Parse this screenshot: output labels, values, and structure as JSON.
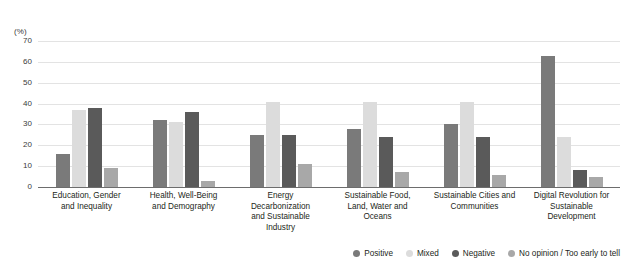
{
  "chart_data": {
    "type": "bar",
    "title": "",
    "subtitle": "",
    "xlabel": "",
    "ylabel": "",
    "unit_label": "(%)",
    "ylim": [
      0,
      70
    ],
    "yticks": [
      0,
      10,
      20,
      30,
      40,
      50,
      60,
      70
    ],
    "grid": true,
    "legend_position": "bottom-right",
    "categories": [
      "Education, Gender and Inequality",
      "Health, Well-Being and Demography",
      "Energy Decarbonization and Sustainable Industry",
      "Sustainable Food, Land, Water and Oceans",
      "Sustainable Cities and Communities",
      "Digital Revolution for Sustainable Development"
    ],
    "category_lines": [
      [
        "Education, Gender",
        "and Inequality"
      ],
      [
        "Health, Well-Being",
        "and Demography"
      ],
      [
        "Energy",
        "Decarbonization",
        "and Sustainable",
        "Industry"
      ],
      [
        "Sustainable Food,",
        "Land, Water and",
        "Oceans"
      ],
      [
        "Sustainable Cities and",
        "Communities"
      ],
      [
        "Digital Revolution for",
        "Sustainable",
        "Development"
      ]
    ],
    "series": [
      {
        "name": "Positive",
        "color": "#7a7a7a",
        "values": [
          16,
          32,
          25,
          28,
          30,
          63
        ]
      },
      {
        "name": "Mixed",
        "color": "#dcdcdc",
        "values": [
          37,
          31,
          41,
          41,
          41,
          24
        ]
      },
      {
        "name": "Negative",
        "color": "#5a5a5a",
        "values": [
          38,
          36,
          25,
          24,
          24,
          8
        ]
      },
      {
        "name": "No opinion / Too early to tell",
        "color": "#a8a8a8",
        "values": [
          9,
          3,
          11,
          7,
          6,
          5
        ]
      }
    ]
  },
  "legend": {
    "items": [
      {
        "label": "Positive",
        "color": "#7a7a7a"
      },
      {
        "label": "Mixed",
        "color": "#dcdcdc"
      },
      {
        "label": "Negative",
        "color": "#5a5a5a"
      },
      {
        "label": "No opinion / Too early to tell",
        "color": "#a8a8a8"
      }
    ]
  }
}
